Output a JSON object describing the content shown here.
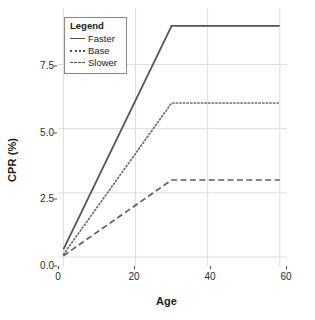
{
  "chart_data": {
    "type": "line",
    "title": "",
    "xlabel": "Age",
    "ylabel": "CPR (%)",
    "xlim": [
      -1.5,
      62
    ],
    "ylim": [
      -0.35,
      9.7
    ],
    "xticks": [
      "0",
      "20",
      "40",
      "60"
    ],
    "xtick_values": [
      0,
      20,
      40,
      60
    ],
    "yticks": [
      "0.0",
      "2.5",
      "5.0",
      "7.5"
    ],
    "ytick_values": [
      0.0,
      2.5,
      5.0,
      7.5
    ],
    "grid": true,
    "grid_color": "#d9d9d9",
    "legend_position": "top-left-inside",
    "legend_title": "Legend",
    "x": [
      0,
      30,
      60
    ],
    "series": [
      {
        "name": "Faster",
        "dash": "solid",
        "color": "#555555",
        "values": [
          0.3,
          9.0,
          9.0
        ]
      },
      {
        "name": "Base",
        "dash": "dotted",
        "color": "#6b6b6b",
        "values": [
          0.1,
          6.0,
          6.0
        ]
      },
      {
        "name": "Slower",
        "dash": "dashed",
        "color": "#5f5f5f",
        "values": [
          0.05,
          3.0,
          3.0
        ]
      }
    ]
  },
  "axes": {
    "x_title": "Age",
    "y_title": "CPR (%)",
    "x_tick_labels": [
      "0",
      "20",
      "40",
      "60"
    ],
    "y_tick_labels": [
      "0.0",
      "2.5",
      "5.0",
      "7.5"
    ]
  },
  "legend": {
    "title": "Legend",
    "items": [
      {
        "label": "Faster",
        "style": "solid"
      },
      {
        "label": "Base",
        "style": "dotted"
      },
      {
        "label": "Slower",
        "style": "dashed"
      }
    ]
  },
  "colors": {
    "line": "#555555",
    "grid": "#d9d9d9",
    "axis_text": "#2b2b2b",
    "title_text": "#1a1a1a",
    "legend_border": "#8a8a8a",
    "background": "#ffffff"
  }
}
